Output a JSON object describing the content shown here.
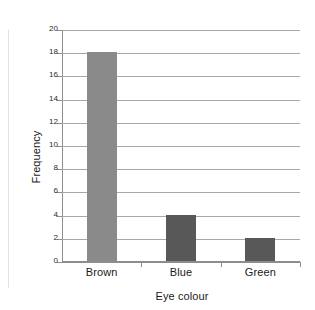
{
  "chart_data": {
    "type": "bar",
    "title": "",
    "xlabel": "Eye colour",
    "ylabel": "Frequency",
    "categories": [
      "Brown",
      "Blue",
      "Green"
    ],
    "values": [
      18,
      4,
      2
    ],
    "bar_colors": [
      "#8a8a8a",
      "#585858",
      "#585858"
    ],
    "ylim": [
      0,
      20
    ],
    "ytick_labels": [
      "0",
      "2",
      "4",
      "6",
      "8",
      "10",
      "12",
      "14",
      "16",
      "18",
      "20"
    ],
    "ytick_values": [
      0,
      2,
      4,
      6,
      8,
      10,
      12,
      14,
      16,
      18,
      20
    ],
    "grid": true,
    "grid_axis": "y",
    "legend": false,
    "legend_position": "none",
    "background_color": "#ffffff",
    "axis_color": "#8d8d8d",
    "grid_color": "#a8a8a8",
    "text_color": "#1a1a1a"
  }
}
